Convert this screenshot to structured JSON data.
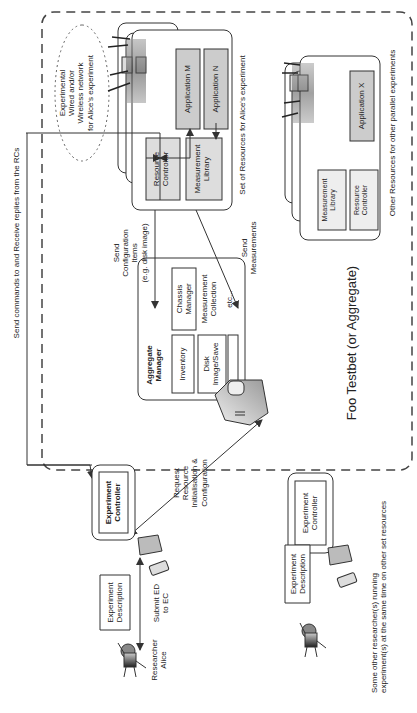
{
  "testbed": {
    "title": "Foo Testbet (or Aggregate)"
  },
  "network": {
    "lines": [
      "Experimental",
      "Wired and/or",
      "Wireless network",
      "for Alice's experiment"
    ]
  },
  "alice_resources": {
    "caption": "Set of Resources for Alice's experiment",
    "resource_controller": [
      "Resource",
      "Controller"
    ],
    "measurement_library": [
      "Measurement",
      "Library"
    ],
    "application_m": "Application M",
    "application_n": "Application N"
  },
  "other_resources": {
    "caption": "Other Resources for other parallel experiments",
    "measurement_library": [
      "Measurement",
      "Library"
    ],
    "resource_controller": [
      "Resource",
      "Controller"
    ],
    "application_x": "Application X"
  },
  "aggregate": {
    "manager": [
      "Aggregate",
      "Manager"
    ],
    "inventory": "Inventory",
    "disk": [
      "Disk",
      "Image/Save"
    ],
    "measurement_collection": [
      "Measurement",
      "Collection"
    ],
    "chassis": [
      "Chassis",
      "Manager"
    ],
    "etc": "etc..."
  },
  "arrows": {
    "send_commands": "Send commands to and Receive replies from the RCs",
    "send_config": [
      "Send",
      "Configuration",
      "Items",
      "(e.g. disk image)"
    ],
    "send_measurements": [
      "Send",
      "Measurements"
    ],
    "request_resource": [
      "Request",
      "Resource",
      "Initialisation &",
      "Configuration"
    ],
    "submit_ed": [
      "Submit ED",
      "to EC"
    ]
  },
  "alice": {
    "experiment_controller": [
      "Experiment",
      "Controller"
    ],
    "experiment_description": [
      "Experiment",
      "Description"
    ],
    "researcher": [
      "Researcher",
      "Alice"
    ]
  },
  "others": {
    "experiment_controller": [
      "Experiment",
      "Controller"
    ],
    "experiment_description": [
      "Experiment",
      "Description"
    ],
    "caption": [
      "Some other researcher(s) running",
      "experiment(s) at the same time on other set resources"
    ]
  }
}
